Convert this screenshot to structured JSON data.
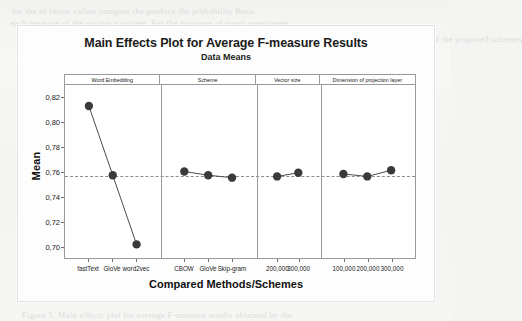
{
  "document": {
    "background_artifacts": [
      {
        "text": "for the of  factor values  compare the produce the  probability  Basic",
        "x": 12,
        "y": 6
      },
      {
        "text": "each  measure  of  the  accuracy  system.  For  the  purposes  of  every  experiment",
        "x": 10,
        "y": 18
      },
      {
        "text": "shows  the  significant  improvement  of  the  proposed  schemes",
        "x": 300,
        "y": 34
      },
      {
        "text": "the  experiment  result",
        "x": 302,
        "y": 50
      },
      {
        "text": "of  the  main  effects",
        "x": 178,
        "y": 146
      },
      {
        "text": "Table  presents  the  comparison",
        "x": 170,
        "y": 150
      },
      {
        "text": "Figure 5.  Main effects plot for average F-measure results obtained by the",
        "x": 22,
        "y": 310
      }
    ]
  },
  "chart_data": {
    "type": "line",
    "title": "Main Effects Plot for Average F-measure Results",
    "subtitle": "Data Means",
    "xlabel": "Compared Methods/Schemes",
    "ylabel": "Mean",
    "ylim": [
      0.69,
      0.83
    ],
    "yticks": [
      0.82,
      0.8,
      0.78,
      0.76,
      0.74,
      0.72,
      0.7
    ],
    "ytick_labels": [
      "0,82",
      "0,80",
      "0,78",
      "0,76",
      "0,74",
      "0,72",
      "0,70"
    ],
    "grid": false,
    "legend": "none",
    "reference_line": {
      "value": 0.757,
      "style": "dashed"
    },
    "marker": {
      "shape": "circle",
      "color": "#3a3a3a",
      "size": 4.2
    },
    "line": {
      "color": "#4a4a4a",
      "width": 1.0
    },
    "panels": [
      {
        "header": "Word Embedding",
        "categories": [
          "fastText",
          "GloVe",
          "word2vec"
        ],
        "values": [
          0.813,
          0.757,
          0.701
        ]
      },
      {
        "header": "Scheme",
        "categories": [
          "CBOW",
          "GloVe",
          "Skip-gram"
        ],
        "values": [
          0.76,
          0.757,
          0.755
        ]
      },
      {
        "header": "Vector size",
        "categories": [
          "200,000",
          "300,000"
        ],
        "values": [
          0.756,
          0.759
        ]
      },
      {
        "header": "Dimension of projection layer",
        "categories": [
          "100,000",
          "200,000",
          "300,000"
        ],
        "values": [
          0.758,
          0.756,
          0.761
        ]
      }
    ]
  }
}
